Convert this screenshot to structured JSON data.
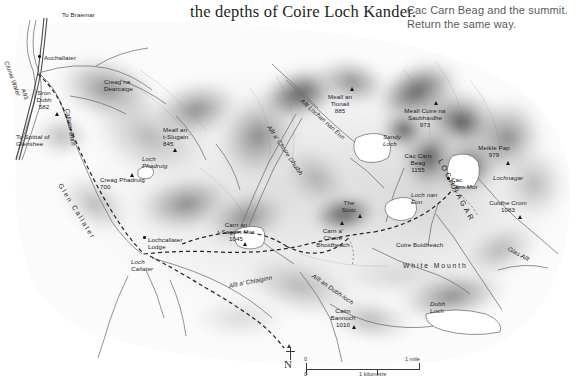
{
  "header": {
    "line_serif": "the depths of Coire Loch Kander.",
    "clipped_line": "",
    "line_sans_1": "Cac Carn Beag and the summit.",
    "line_sans_2": "Return the same way."
  },
  "map": {
    "title_region": "Lochnagar and the White Mounth, Cairngorms",
    "colors": {
      "paper": "#ffffff",
      "relief_dark": "#4a4a4a",
      "relief_mid": "#9a9a9a",
      "relief_light": "#d9d9d9",
      "label_text": "#221e1f",
      "water_line": "#6f6f6f",
      "path_dash": "#2b2b2b"
    },
    "labels": [
      {
        "name": "to-braemar",
        "text": "To Braemar",
        "x": 62,
        "y": 11,
        "style": "left"
      },
      {
        "name": "auchallater",
        "text": "Auchallater",
        "x": 44,
        "y": 54,
        "style": "left"
      },
      {
        "name": "clunie-water",
        "text": "Clunie Water",
        "x": 10,
        "y": 60,
        "style": "ital rot",
        "rot": 70
      },
      {
        "name": "a93",
        "text": "A93",
        "x": 26,
        "y": 88,
        "style": "road rot",
        "rot": 72
      },
      {
        "name": "sron-dubh",
        "text": "Sron\nDubh\n582",
        "x": 44,
        "y": 89,
        "style": ""
      },
      {
        "name": "to-spittal-of-glenshee",
        "text": "To Spittal of\nGlenshee",
        "x": 16,
        "y": 133,
        "style": "left"
      },
      {
        "name": "creag-na-dearcaige",
        "text": "Creag na\nDearcaige",
        "x": 104,
        "y": 78,
        "style": "left"
      },
      {
        "name": "callater-burn",
        "text": "Callater Burn",
        "x": 71,
        "y": 108,
        "style": "ital rot",
        "rot": 80
      },
      {
        "name": "meall-an-t-slugain",
        "text": "Meall an\nt-Slugain\n845",
        "x": 163,
        "y": 126,
        "style": "left"
      },
      {
        "name": "loch-phadruig",
        "text": "Loch\nPhadruig",
        "x": 142,
        "y": 155,
        "style": "ital left"
      },
      {
        "name": "creag-phadruig",
        "text": "Creag Phadruig\n700",
        "x": 100,
        "y": 176,
        "style": "left"
      },
      {
        "name": "glen-callater",
        "text": "Glen Callater",
        "x": 63,
        "y": 182,
        "style": "wide rot",
        "rot": 58
      },
      {
        "name": "lochcallater-lodge",
        "text": "Lochcallater\nLodge",
        "x": 148,
        "y": 236,
        "style": "left"
      },
      {
        "name": "loch-callater",
        "text": "Loch\nCallater",
        "x": 131,
        "y": 258,
        "style": "ital left"
      },
      {
        "name": "allt-a-chlaiginn",
        "text": "Allt a' Chlaiginn",
        "x": 228,
        "y": 282,
        "style": "ital rot",
        "rot": -11
      },
      {
        "name": "allt-a-choire-dhuibh",
        "text": "Allt a' Choire Dhuibh",
        "x": 272,
        "y": 124,
        "style": "ital rot",
        "rot": 56
      },
      {
        "name": "allt-lochan-nan-eun",
        "text": "Allt Lochan nan Eun",
        "x": 304,
        "y": 97,
        "style": "ital rot",
        "rot": 42
      },
      {
        "name": "meall-an-tionail",
        "text": "Meall an\nTionail\n885",
        "x": 340,
        "y": 93,
        "style": ""
      },
      {
        "name": "sandy-loch",
        "text": "Sandy\nLoch",
        "x": 383,
        "y": 133,
        "style": "ital left"
      },
      {
        "name": "loch-nan-eun",
        "text": "Loch nan\nEun",
        "x": 411,
        "y": 191,
        "style": "ital left"
      },
      {
        "name": "the-stuic",
        "text": "The\nStuic",
        "x": 349,
        "y": 199,
        "style": ""
      },
      {
        "name": "carn-an-t-sagairt-mor",
        "text": "Carn an\nt-Sagairt Mor\n1045",
        "x": 236,
        "y": 221,
        "style": ""
      },
      {
        "name": "carn-a-choire-bhoidheach",
        "text": "Carn a'\nChoire\nBhoidheach",
        "x": 333,
        "y": 227,
        "style": ""
      },
      {
        "name": "coire-boidheach",
        "text": "Coire Boidheach",
        "x": 396,
        "y": 241,
        "style": "left"
      },
      {
        "name": "meall-coire-na-saobhaidhe",
        "text": "Meall Coire na\nSaobhaidhe\n973",
        "x": 425,
        "y": 107,
        "style": ""
      },
      {
        "name": "cac-carn-beag",
        "text": "Cac Carn\nBeag\n1155",
        "x": 418,
        "y": 152,
        "style": ""
      },
      {
        "name": "cac-carn-mor",
        "text": "Cac\nCarn Mor",
        "x": 451,
        "y": 176,
        "style": "left"
      },
      {
        "name": "meikle-pap",
        "text": "Meikle Pap\n979",
        "x": 494,
        "y": 144,
        "style": ""
      },
      {
        "name": "lochnagar-corrie",
        "text": "Lochnagar",
        "x": 493,
        "y": 174,
        "style": "ital left"
      },
      {
        "name": "lochnagar-range",
        "text": "LOCHNAGAR",
        "x": 443,
        "y": 158,
        "style": "wide2 rot",
        "rot": 62
      },
      {
        "name": "cuidhe-crom",
        "text": "Cuidhe Crom\n1083",
        "x": 508,
        "y": 199,
        "style": ""
      },
      {
        "name": "glas-allt",
        "text": "Glas Allt",
        "x": 510,
        "y": 245,
        "style": "ital rot",
        "rot": 28
      },
      {
        "name": "white-mounth",
        "text": "White Mounth",
        "x": 403,
        "y": 262,
        "style": "wide left"
      },
      {
        "name": "allt-an-dubh-loch",
        "text": "Allt an Dubh-loch",
        "x": 315,
        "y": 272,
        "style": "ital rot",
        "rot": 35
      },
      {
        "name": "cairn-bannoch",
        "text": "Cairn\nBannoch\n1010",
        "x": 343,
        "y": 307,
        "style": ""
      },
      {
        "name": "dubh-loch",
        "text": "Dubh\nLoch",
        "x": 430,
        "y": 300,
        "style": "ital left"
      }
    ],
    "peak_markers": [
      {
        "name": "peak-sron-dubh",
        "x": 55,
        "y": 112
      },
      {
        "name": "peak-meall-an-t-slugain",
        "x": 173,
        "y": 148
      },
      {
        "name": "peak-creag-phadruig",
        "x": 130,
        "y": 173
      },
      {
        "name": "peak-carn-an-t-sagairt-mor",
        "x": 243,
        "y": 242
      },
      {
        "name": "peak-meall-an-tionail",
        "x": 350,
        "y": 87
      },
      {
        "name": "peak-carn-a-choire",
        "x": 340,
        "y": 221
      },
      {
        "name": "peak-meall-coire",
        "x": 434,
        "y": 101
      },
      {
        "name": "peak-meikle-pap",
        "x": 506,
        "y": 161
      },
      {
        "name": "peak-cuidhe-crom",
        "x": 518,
        "y": 215
      },
      {
        "name": "peak-cairn-bannoch",
        "x": 352,
        "y": 325
      },
      {
        "name": "peak-the-stuic",
        "x": 358,
        "y": 214
      }
    ],
    "settlement_dots": [
      {
        "name": "dot-auchallater",
        "x": 38,
        "y": 55
      },
      {
        "name": "dot-lochcallater-lodge",
        "x": 143,
        "y": 236
      },
      {
        "name": "dot-cac-carn-mor",
        "x": 447,
        "y": 177
      }
    ]
  },
  "scale": {
    "compass_label": "N",
    "miles_zero": "0",
    "miles_max": "1 mile",
    "km_zero": "0",
    "km_max": "1 kilometre"
  }
}
